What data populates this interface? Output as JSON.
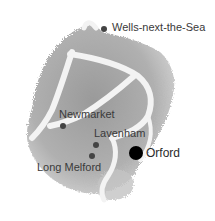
{
  "map": {
    "type": "illustrated-region-map",
    "colors": {
      "land": "#a8a8a8",
      "land_dark": "#8f8f8f",
      "roads": "#f2f2f2",
      "dot": "#3a3a3a",
      "dot_highlight": "#000000",
      "label": "#3a3a3a"
    },
    "places": [
      {
        "name": "Wells-next-the-Sea",
        "highlight": false
      },
      {
        "name": "Newmarket",
        "highlight": false
      },
      {
        "name": "Lavenham",
        "highlight": false
      },
      {
        "name": "Long Melford",
        "highlight": false
      },
      {
        "name": "Orford",
        "highlight": true
      }
    ]
  }
}
